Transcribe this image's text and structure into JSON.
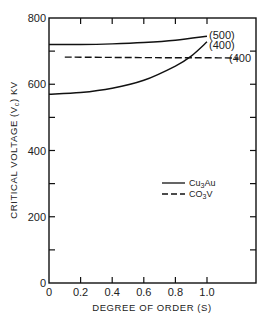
{
  "chart_data": {
    "type": "line",
    "title": "",
    "xlabel": "DEGREE OF ORDER (S)",
    "ylabel": "CRITICAL VOLTAGE (Vc) KV",
    "xlim": [
      0,
      1.3
    ],
    "ylim": [
      0,
      800
    ],
    "x_ticks": [
      "0",
      "0.2",
      "0.4",
      "0.6",
      "0.8",
      "1.0"
    ],
    "y_ticks": [
      "0",
      "200",
      "400",
      "600",
      "800"
    ],
    "grid": false,
    "legend_position": "right-middle",
    "legend": [
      {
        "label": "Cu3Au",
        "style": "solid"
      },
      {
        "label": "CO3V",
        "style": "dashed"
      }
    ],
    "series": [
      {
        "name": "Cu3Au (500)",
        "style": "solid",
        "annotation": "(500)",
        "x": [
          0,
          0.2,
          0.4,
          0.6,
          0.8,
          1.0
        ],
        "y": [
          720,
          720,
          722,
          726,
          733,
          745
        ]
      },
      {
        "name": "Cu3Au (400)",
        "style": "solid",
        "annotation": "(400)",
        "x": [
          0,
          0.2,
          0.4,
          0.6,
          0.8,
          0.9,
          1.0
        ],
        "y": [
          570,
          575,
          588,
          612,
          655,
          685,
          728
        ]
      },
      {
        "name": "CO3V (400)",
        "style": "dashed",
        "annotation": "(400",
        "x": [
          0.1,
          0.4,
          0.8,
          1.0,
          1.2
        ],
        "y": [
          682,
          681,
          680,
          680,
          679
        ]
      }
    ]
  },
  "labels": {
    "xlabel": "DEGREE OF ORDER (S)",
    "ylabel": "CRITICAL VOLTAGE (V",
    "ylabel_sub": "c",
    "ylabel_tail": ") KV",
    "legend_solid": "Cu",
    "legend_solid_sub": "3",
    "legend_solid_tail": "Au",
    "legend_dashed": "CO",
    "legend_dashed_sub": "3",
    "legend_dashed_tail": "V",
    "ann_500": "(500)",
    "ann_400": "(400)",
    "ann_400_dashed": "(400"
  }
}
